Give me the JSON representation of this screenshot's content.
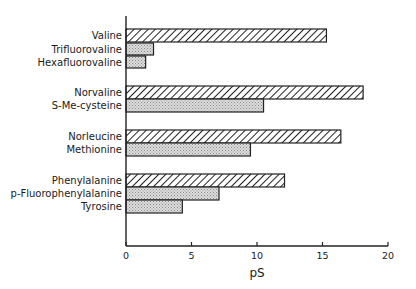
{
  "chart_data": {
    "type": "bar",
    "orientation": "horizontal",
    "title": "",
    "xlabel": "pS",
    "ylabel": "",
    "xlim": [
      0,
      20
    ],
    "xticks": [
      0,
      5,
      10,
      15,
      20
    ],
    "grid": false,
    "legend": null,
    "groups": [
      {
        "bars": [
          {
            "label": "Valine",
            "value": 15.3,
            "fill": "hatched"
          },
          {
            "label": "Trifluorovaline",
            "value": 2.1,
            "fill": "stippled"
          },
          {
            "label": "Hexafluorovaline",
            "value": 1.5,
            "fill": "stippled"
          }
        ]
      },
      {
        "bars": [
          {
            "label": "Norvaline",
            "value": 18.1,
            "fill": "hatched"
          },
          {
            "label": "S-Me-cysteine",
            "value": 10.5,
            "fill": "stippled"
          }
        ]
      },
      {
        "bars": [
          {
            "label": "Norleucine",
            "value": 16.4,
            "fill": "hatched"
          },
          {
            "label": "Methionine",
            "value": 9.5,
            "fill": "stippled"
          }
        ]
      },
      {
        "bars": [
          {
            "label": "Phenylalanine",
            "value": 12.1,
            "fill": "hatched"
          },
          {
            "label": "p-Fluorophenylalanine",
            "value": 7.1,
            "fill": "stippled"
          },
          {
            "label": "Tyrosine",
            "value": 4.3,
            "fill": "stippled"
          }
        ]
      }
    ],
    "categories": [
      "Valine",
      "Trifluorovaline",
      "Hexafluorovaline",
      "Norvaline",
      "S-Me-cysteine",
      "Norleucine",
      "Methionine",
      "Phenylalanine",
      "p-Fluorophenylalanine",
      "Tyrosine"
    ],
    "values": [
      15.3,
      2.1,
      1.5,
      18.1,
      10.5,
      16.4,
      9.5,
      12.1,
      7.1,
      4.3
    ]
  },
  "layout": {
    "x0": 126,
    "px_per_unit": 13.1,
    "axis_y": 246,
    "axis_top": 16,
    "bar_rows": [
      {
        "y": 29,
        "h": 13
      },
      {
        "y": 43,
        "h": 12
      },
      {
        "y": 56,
        "h": 12
      },
      {
        "y": 86,
        "h": 13
      },
      {
        "y": 99,
        "h": 13
      },
      {
        "y": 130,
        "h": 13
      },
      {
        "y": 143,
        "h": 13
      },
      {
        "y": 174,
        "h": 13
      },
      {
        "y": 187,
        "h": 13
      },
      {
        "y": 200,
        "h": 13
      }
    ]
  }
}
